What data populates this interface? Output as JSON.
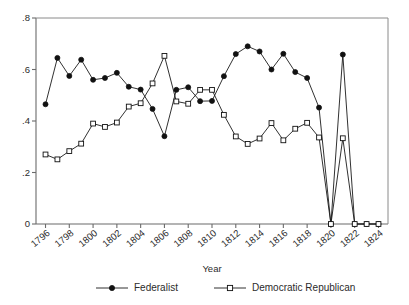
{
  "chart_data": {
    "type": "line",
    "title": "",
    "xlabel": "Year",
    "ylabel": "",
    "xlim": [
      1795.2,
      1824.8
    ],
    "ylim": [
      0,
      0.8
    ],
    "grid": false,
    "legend_position": "bottom",
    "x": [
      1796,
      1797,
      1798,
      1799,
      1800,
      1801,
      1802,
      1803,
      1804,
      1805,
      1806,
      1807,
      1808,
      1809,
      1810,
      1811,
      1812,
      1813,
      1814,
      1815,
      1816,
      1817,
      1818,
      1819,
      1820,
      1821,
      1822,
      1823,
      1824
    ],
    "xticks": [
      1796,
      1798,
      1800,
      1802,
      1804,
      1806,
      1808,
      1810,
      1812,
      1814,
      1816,
      1818,
      1820,
      1822,
      1824
    ],
    "xtick_labels": [
      "1796",
      "1798",
      "1800",
      "1802",
      "1804",
      "1806",
      "1808",
      "1810",
      "1812",
      "1814",
      "1816",
      "1818",
      "1820",
      "1822",
      "1824"
    ],
    "yticks": [
      0,
      0.2,
      0.4,
      0.6,
      0.8
    ],
    "ytick_labels": [
      "0",
      ".2",
      ".4",
      ".6",
      ".8"
    ],
    "series": [
      {
        "name": "Federalist",
        "marker": "filled-circle",
        "values": [
          0.465,
          0.645,
          0.575,
          0.638,
          0.56,
          0.567,
          0.587,
          0.533,
          0.522,
          0.447,
          0.341,
          0.521,
          0.531,
          0.477,
          0.478,
          0.574,
          0.66,
          0.69,
          0.67,
          0.6,
          0.661,
          0.59,
          0.567,
          0.452,
          0.0,
          0.658,
          0.0,
          0.0,
          0.0
        ]
      },
      {
        "name": "Democratic Republican",
        "marker": "open-square",
        "values": [
          0.27,
          0.251,
          0.283,
          0.312,
          0.39,
          0.377,
          0.394,
          0.456,
          0.469,
          0.546,
          0.653,
          0.476,
          0.467,
          0.521,
          0.521,
          0.424,
          0.34,
          0.311,
          0.332,
          0.392,
          0.325,
          0.37,
          0.393,
          0.336,
          0.0,
          0.333,
          0.0,
          0.0,
          0.0
        ]
      }
    ],
    "legend": [
      {
        "label": "Federalist",
        "marker": "filled-circle"
      },
      {
        "label": "Democratic Republican",
        "marker": "open-square"
      }
    ]
  }
}
